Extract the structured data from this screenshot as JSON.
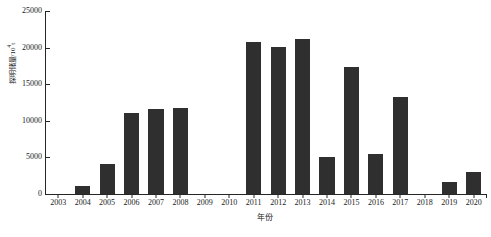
{
  "chart_data": {
    "type": "bar",
    "title": "",
    "subtitle": "",
    "xlabel": "年份",
    "ylabel": "探明储量/10",
    "ylabel_sup": "4",
    "ylabel_unit_tail": "t",
    "ylabel_full": "探明储量/10⁴t",
    "categories": [
      "2003",
      "2004",
      "2005",
      "2006",
      "2007",
      "2008",
      "2009",
      "2010",
      "2011",
      "2012",
      "2013",
      "2014",
      "2015",
      "2016",
      "2017",
      "2018",
      "2019",
      "2020"
    ],
    "values": [
      0,
      1100,
      4100,
      11100,
      11600,
      11800,
      0,
      0,
      20800,
      20100,
      21200,
      5000,
      17300,
      5500,
      13300,
      0,
      1650,
      3050
    ],
    "ylim": [
      0,
      25000
    ],
    "y_ticks": [
      0,
      5000,
      10000,
      15000,
      20000,
      25000
    ],
    "y_tick_labels": [
      "0",
      "5000",
      "10000",
      "15000",
      "20000",
      "25000"
    ],
    "grid": false,
    "legend": false,
    "legend_position": "none",
    "bar_color": "#2f2f2f",
    "axis_color": "#262626",
    "background_color": "#ffffff"
  }
}
